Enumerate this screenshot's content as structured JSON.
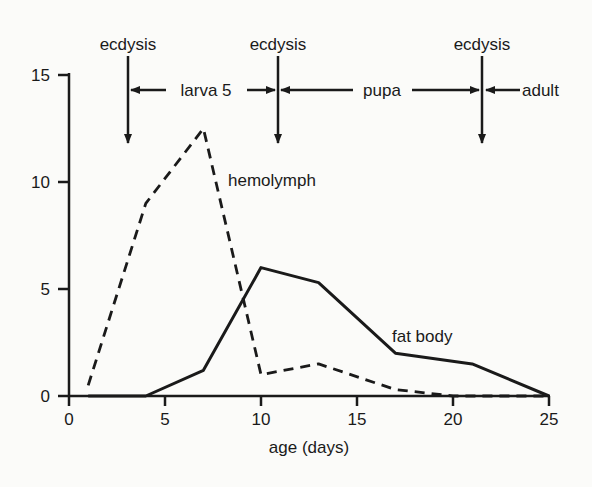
{
  "chart_data": {
    "type": "line",
    "title": "",
    "xlabel": "age (days)",
    "ylabel": "",
    "xlim": [
      0,
      25
    ],
    "ylim": [
      0,
      15
    ],
    "x_ticks": [
      "0",
      "5",
      "10",
      "15",
      "20",
      "25"
    ],
    "y_ticks": [
      "0",
      "5",
      "10",
      "15"
    ],
    "grid": false,
    "legend": "inline labels",
    "series": [
      {
        "name": "hemolymph",
        "style": "dashed",
        "x": [
          1,
          4,
          7,
          10,
          13,
          17,
          20,
          25
        ],
        "values": [
          0.5,
          9,
          12.5,
          1,
          1.5,
          0.3,
          0,
          0
        ]
      },
      {
        "name": "fat body",
        "style": "solid",
        "x": [
          1,
          4,
          7,
          10,
          13,
          17,
          21,
          25
        ],
        "values": [
          0,
          0,
          1.2,
          6,
          5.3,
          2,
          1.5,
          0
        ]
      }
    ],
    "annotations": {
      "ecdysis": [
        {
          "label": "ecdysis",
          "day": 3
        },
        {
          "label": "ecdysis",
          "day": 11
        },
        {
          "label": "ecdysis",
          "day": 21.5
        }
      ],
      "stages": [
        {
          "label": "larva 5"
        },
        {
          "label": "pupa"
        },
        {
          "label": "adult"
        }
      ]
    }
  }
}
